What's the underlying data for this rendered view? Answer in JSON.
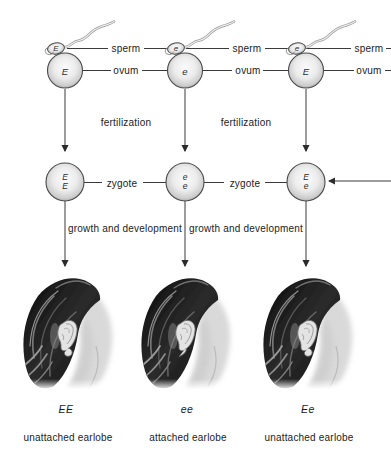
{
  "labels": {
    "sperm": "sperm",
    "ovum": "ovum",
    "zygote": "zygote",
    "fertilization": "fertilization",
    "growth": "growth and development"
  },
  "columns": [
    {
      "sperm_allele": "E",
      "ovum_allele": "E",
      "zygote_top": "E",
      "zygote_bottom": "E",
      "genotype": "EE",
      "phenotype": "unattached earlobe",
      "earlobe_type": "unattached"
    },
    {
      "sperm_allele": "e",
      "ovum_allele": "e",
      "zygote_top": "e",
      "zygote_bottom": "e",
      "genotype": "ee",
      "phenotype": "attached earlobe",
      "earlobe_type": "attached"
    },
    {
      "sperm_allele": "e",
      "ovum_allele": "E",
      "zygote_top": "E",
      "zygote_bottom": "e",
      "genotype": "Ee",
      "phenotype": "unattached earlobe",
      "earlobe_type": "unattached"
    }
  ],
  "palette": {
    "line": "#3a3a3a",
    "text": "#1c1c1c",
    "cell_rim": "#4a4a4a",
    "cell_light": "#fbfbfb",
    "cell_dark": "#9f9f9f",
    "hair_dark": "#101010",
    "skin": "#d9d9d9",
    "background": "#ffffff"
  }
}
